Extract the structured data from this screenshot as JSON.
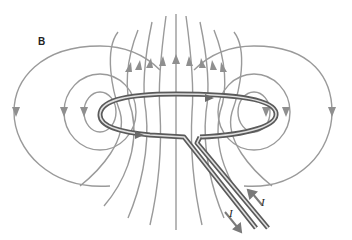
{
  "diagram": {
    "field_label": "B",
    "current_labels": [
      "I",
      "I"
    ],
    "colors": {
      "field_lines": "#9a9a9a",
      "wire": "#5a5a5a",
      "wire_highlight": "#d8d8d8",
      "text": "#222222"
    },
    "elements": {
      "loop": "current-carrying circular loop (seen in perspective)",
      "leads": "two parallel lead wires exiting toward bottom-right",
      "field_lines": "closed field lines circling each side of the wire, vertical through loop center pointing up",
      "arrows": "downward arrows on outer side loops, upward arrows above loop center, current arrows along leads"
    }
  }
}
